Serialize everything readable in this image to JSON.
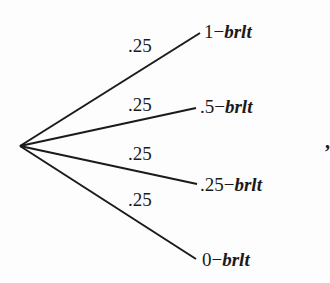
{
  "diagram": {
    "type": "probability-tree",
    "root": {
      "x": 20,
      "y": 146
    },
    "branches": [
      {
        "probability": ".25",
        "outcome_value": "1",
        "dash": "−",
        "outcome_var": "brlt",
        "end": {
          "x": 200,
          "y": 33
        }
      },
      {
        "probability": ".25",
        "outcome_value": ".5",
        "dash": "−",
        "outcome_var": "brlt",
        "end": {
          "x": 196,
          "y": 108
        }
      },
      {
        "probability": ".25",
        "outcome_value": ".25",
        "dash": "−",
        "outcome_var": "brlt",
        "end": {
          "x": 197,
          "y": 184
        }
      },
      {
        "probability": ".25",
        "outcome_value": "0",
        "dash": "−",
        "outcome_var": "brlt",
        "end": {
          "x": 196,
          "y": 259
        }
      }
    ],
    "trailing_punctuation": ",",
    "line_color": "#1a1a1a"
  }
}
